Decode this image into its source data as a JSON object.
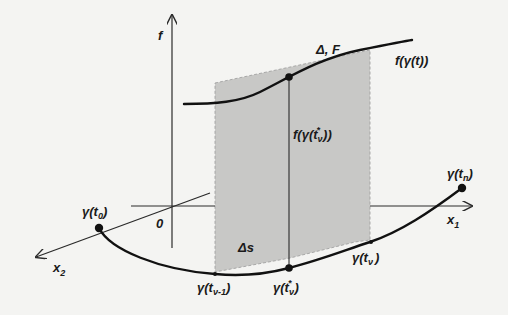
{
  "diagram": {
    "axes": {
      "f": "f",
      "x1": "x",
      "x1_sub": "1",
      "x2": "x",
      "x2_sub": "2",
      "origin": "0"
    },
    "labels": {
      "surface_curve": "f(γ(t))",
      "strip_area": "Δ, F",
      "height": "f(γ(t",
      "height_sub": "ν",
      "height_sup": "*",
      "height_close": "))",
      "arc_length": "Δs"
    },
    "points": {
      "start": {
        "pre": "γ(t",
        "sub": "0",
        "post": ")"
      },
      "end": {
        "pre": "γ(t",
        "sub": "n",
        "post": ")"
      },
      "prev": {
        "pre": "γ(t",
        "sub": "ν-1",
        "post": ")"
      },
      "mid": {
        "pre": "γ(t",
        "sub": "ν",
        "sup": "*",
        "post": ")"
      },
      "curr": {
        "pre": "γ(t",
        "sub": "ν",
        "post": ")"
      }
    },
    "colors": {
      "strip_fill": "#c8c8c6",
      "ink": "#111111",
      "background": "#f4f4f2"
    }
  }
}
